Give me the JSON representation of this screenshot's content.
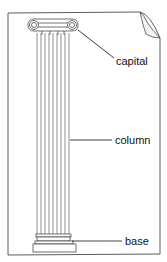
{
  "diagram": {
    "labels": {
      "capital": "capital",
      "column": "column",
      "base": "base"
    }
  }
}
